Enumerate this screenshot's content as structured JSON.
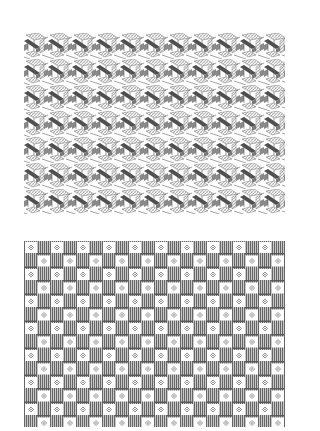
{
  "figures": [
    {
      "id": "top",
      "description": "isometric woven-band cube pattern",
      "tile": {
        "width": 24,
        "height": 26
      },
      "colors": {
        "dark_band": "#555555",
        "mid_band": "#8a8a8a",
        "hatch": "#b0b0b0",
        "background": "#ffffff"
      }
    },
    {
      "id": "bottom",
      "description": "checkerboard of white cells with diamond motif and striped gray cells",
      "tile": {
        "width": 26,
        "height": 27
      },
      "grid": {
        "columns": 20,
        "rows": 14
      },
      "colors": {
        "stripe": "#6e6e6e",
        "light_stripe": "#cfcfcf",
        "cell": "#ffffff",
        "motif": "#7a7a7a"
      }
    }
  ]
}
